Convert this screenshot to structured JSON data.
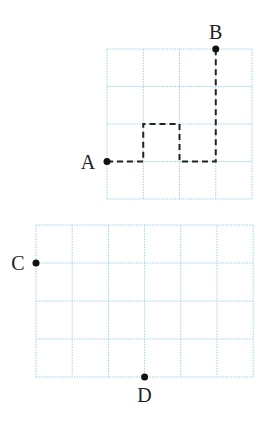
{
  "diagram": {
    "grids": [
      {
        "id": "top-grid",
        "x": 107,
        "y": 49,
        "cols": 4,
        "rows": 4,
        "cell_w": 36.25,
        "cell_h": 37.5,
        "grid_color": "#9fd3ea",
        "points": [
          {
            "label": "A",
            "col": 0,
            "row": 3,
            "label_dx": -19,
            "label_dy": 7
          },
          {
            "label": "B",
            "col": 3,
            "row": 0,
            "label_dx": 0,
            "label_dy": -10
          }
        ],
        "path": {
          "style": "dashed",
          "color": "#222222",
          "vertices": [
            [
              0,
              3
            ],
            [
              1,
              3
            ],
            [
              1,
              2
            ],
            [
              2,
              2
            ],
            [
              2,
              3
            ],
            [
              3,
              3
            ],
            [
              3,
              0
            ]
          ]
        }
      },
      {
        "id": "bottom-grid",
        "x": 36,
        "y": 225,
        "cols": 6,
        "rows": 4,
        "cell_w": 36.2,
        "cell_h": 38,
        "grid_color": "#9fd3ea",
        "points": [
          {
            "label": "C",
            "col": 0,
            "row": 1,
            "label_dx": -18,
            "label_dy": 7
          },
          {
            "label": "D",
            "col": 3,
            "row": 4,
            "label_dx": 0,
            "label_dy": 25
          }
        ]
      }
    ]
  }
}
